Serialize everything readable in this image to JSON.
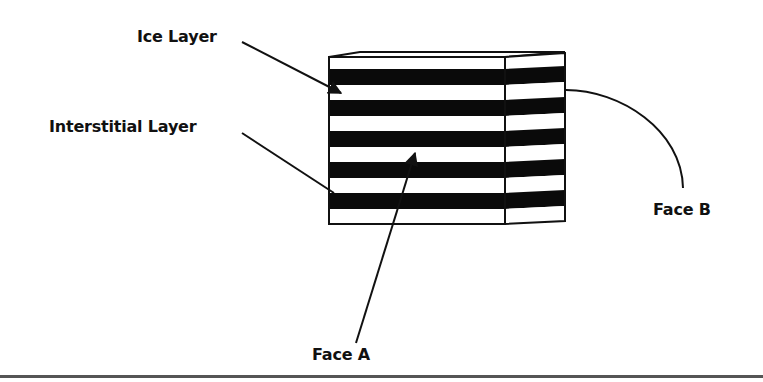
{
  "diagram": {
    "labels": {
      "ice_layer": "Ice Layer",
      "interstitial_layer": "Interstitial Layer",
      "face_a": "Face A",
      "face_b": "Face B"
    },
    "block": {
      "layers_top_to_bottom": [
        "ice",
        "interstitial",
        "ice",
        "interstitial",
        "ice",
        "interstitial",
        "ice",
        "interstitial",
        "ice",
        "interstitial",
        "ice"
      ],
      "colors": {
        "ice": "#ffffff",
        "interstitial": "#0a0a0a",
        "outline": "#111111"
      }
    }
  }
}
